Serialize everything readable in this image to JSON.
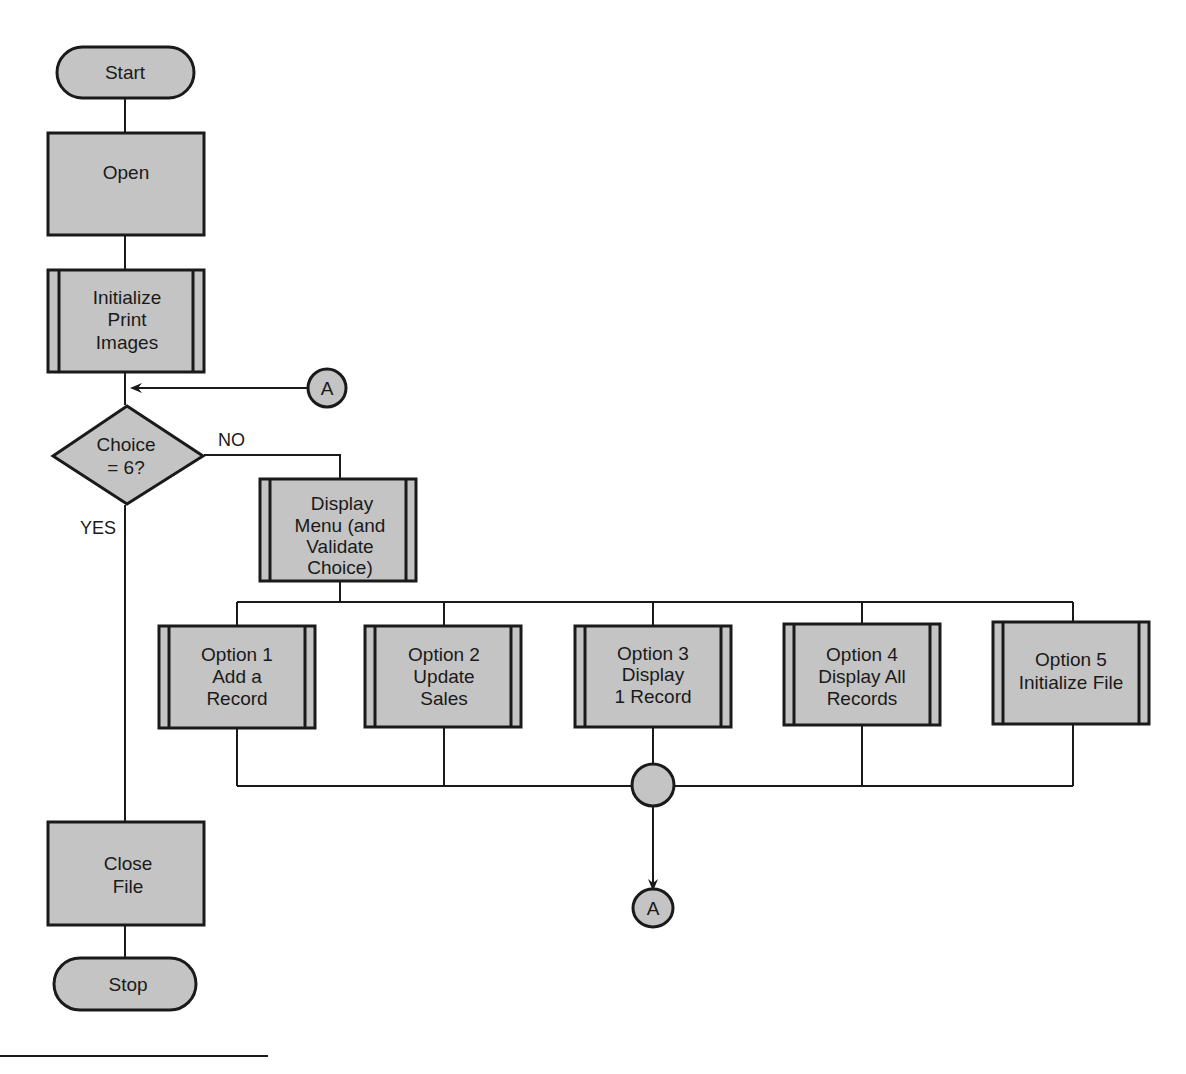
{
  "diagram": {
    "type": "flowchart",
    "colors": {
      "fill": "#c4c4c4",
      "stroke": "#1a1a1a",
      "background": "#ffffff"
    },
    "nodes": {
      "start": {
        "kind": "terminal",
        "lines": [
          "Start"
        ]
      },
      "open": {
        "kind": "process",
        "lines": [
          "Open"
        ]
      },
      "init_print": {
        "kind": "predefined-process",
        "lines": [
          "Initialize",
          "Print",
          "Images"
        ]
      },
      "connector_a_in": {
        "kind": "connector",
        "lines": [
          "A"
        ]
      },
      "decision": {
        "kind": "decision",
        "lines": [
          "Choice",
          "= 6?"
        ]
      },
      "display_menu": {
        "kind": "predefined-process",
        "lines": [
          "Display",
          "Menu (and",
          "Validate",
          "Choice)"
        ]
      },
      "option1": {
        "kind": "predefined-process",
        "lines": [
          "Option 1",
          "Add a",
          "Record"
        ]
      },
      "option2": {
        "kind": "predefined-process",
        "lines": [
          "Option 2",
          "Update",
          "Sales"
        ]
      },
      "option3": {
        "kind": "predefined-process",
        "lines": [
          "Option 3",
          "Display",
          "1 Record"
        ]
      },
      "option4": {
        "kind": "predefined-process",
        "lines": [
          "Option 4",
          "Display All",
          "Records"
        ]
      },
      "option5": {
        "kind": "predefined-process",
        "lines": [
          "Option 5",
          "Initialize File"
        ]
      },
      "junction": {
        "kind": "junction",
        "lines": []
      },
      "connector_a_out": {
        "kind": "connector",
        "lines": [
          "A"
        ]
      },
      "close_file": {
        "kind": "process",
        "lines": [
          "Close",
          "File"
        ]
      },
      "stop": {
        "kind": "terminal",
        "lines": [
          "Stop"
        ]
      }
    },
    "edge_labels": {
      "no": "NO",
      "yes": "YES"
    },
    "edges": [
      [
        "start",
        "open"
      ],
      [
        "open",
        "init_print"
      ],
      [
        "init_print",
        "decision"
      ],
      [
        "connector_a_in",
        "decision"
      ],
      [
        "decision",
        "display_menu",
        "NO"
      ],
      [
        "decision",
        "close_file",
        "YES"
      ],
      [
        "display_menu",
        "option1"
      ],
      [
        "display_menu",
        "option2"
      ],
      [
        "display_menu",
        "option3"
      ],
      [
        "display_menu",
        "option4"
      ],
      [
        "display_menu",
        "option5"
      ],
      [
        "option1",
        "junction"
      ],
      [
        "option2",
        "junction"
      ],
      [
        "option3",
        "junction"
      ],
      [
        "option4",
        "junction"
      ],
      [
        "option5",
        "junction"
      ],
      [
        "junction",
        "connector_a_out"
      ],
      [
        "close_file",
        "stop"
      ]
    ]
  }
}
